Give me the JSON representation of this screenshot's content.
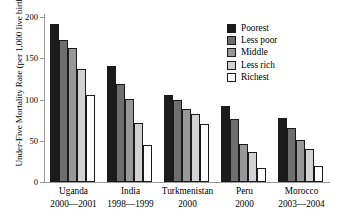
{
  "chart_data": {
    "type": "bar",
    "title": "",
    "xlabel": "",
    "ylabel": "Under-Five Mortality Rate (per 1,000 live births)",
    "ylim": [
      0,
      200
    ],
    "yticks": [
      0,
      50,
      100,
      150,
      200
    ],
    "grid": false,
    "legend_position": "top-right",
    "categories": [
      "Uganda 2000—2001",
      "India 1998—1999",
      "Turkmenistan 2000",
      "Peru 2000",
      "Morocco 2003—2004"
    ],
    "series": [
      {
        "name": "Poorest",
        "color": "#1c1c1c",
        "values": [
          192,
          141,
          105,
          92,
          78
        ]
      },
      {
        "name": "Less poor",
        "color": "#6e6e6e",
        "values": [
          172,
          119,
          99,
          76,
          65
        ]
      },
      {
        "name": "Middle",
        "color": "#989898",
        "values": [
          163,
          101,
          88,
          46,
          51
        ]
      },
      {
        "name": "Less rich",
        "color": "#d2d2d2",
        "values": [
          137,
          71,
          83,
          36,
          40
        ]
      },
      {
        "name": "Richest",
        "color": "#ffffff",
        "values": [
          106,
          45,
          70,
          17,
          20
        ]
      }
    ]
  },
  "axis": {
    "y_title": "Under-Five Mortality Rate (per 1,000 live births)",
    "y_ticks": [
      "200",
      "150",
      "100",
      "50",
      "0"
    ]
  },
  "legend": {
    "items": [
      {
        "label": "Poorest",
        "color": "#1c1c1c"
      },
      {
        "label": "Less poor",
        "color": "#6e6e6e"
      },
      {
        "label": "Middle",
        "color": "#989898"
      },
      {
        "label": "Less rich",
        "color": "#d2d2d2"
      },
      {
        "label": "Richest",
        "color": "#ffffff"
      }
    ]
  },
  "xaxis": {
    "groups": [
      {
        "country": "Uganda",
        "years": "2000—2001"
      },
      {
        "country": "India",
        "years": "1998—1999"
      },
      {
        "country": "Turkmenistan",
        "years": "2000"
      },
      {
        "country": "Peru",
        "years": "2000"
      },
      {
        "country": "Morocco",
        "years": "2003—2004"
      }
    ]
  }
}
